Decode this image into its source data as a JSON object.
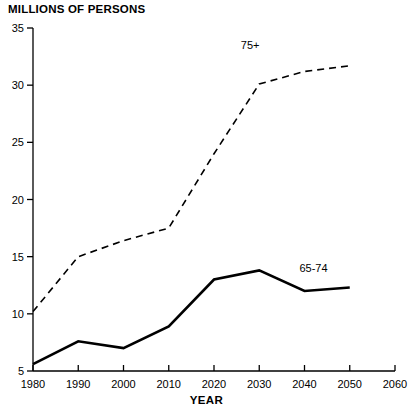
{
  "chart_data": {
    "type": "line",
    "title": "",
    "ylabel": "MILLIONS OF PERSONS",
    "xlabel": "YEAR",
    "x": [
      1980,
      1990,
      2000,
      2010,
      2020,
      2030,
      2040,
      2050
    ],
    "xlim": [
      1980,
      2060
    ],
    "ylim": [
      5,
      35
    ],
    "xticks": [
      1980,
      1990,
      2000,
      2010,
      2020,
      2030,
      2040,
      2050,
      2060
    ],
    "yticks": [
      5,
      10,
      15,
      20,
      25,
      30,
      35
    ],
    "grid": false,
    "legend": "inline-labels",
    "series": [
      {
        "name": "75+",
        "style": "dashed",
        "color": "#000000",
        "values": [
          10.2,
          15.0,
          16.4,
          17.5,
          24.0,
          30.1,
          31.2,
          31.7
        ],
        "label_x": 2028,
        "label_y": 33.2
      },
      {
        "name": "65-74",
        "style": "solid",
        "color": "#000000",
        "values": [
          5.6,
          7.6,
          7.0,
          8.9,
          13.0,
          13.8,
          12.0,
          12.3
        ],
        "label_x": 2042,
        "label_y": 13.7
      }
    ]
  },
  "axis": {
    "y_title": "MILLIONS OF PERSONS",
    "x_title": "YEAR",
    "y_tick_labels": [
      "35",
      "30",
      "25",
      "20",
      "15",
      "10",
      "5"
    ],
    "x_tick_labels": [
      "1980",
      "1990",
      "2000",
      "2010",
      "2020",
      "2030",
      "2040",
      "2050",
      "2060"
    ]
  }
}
